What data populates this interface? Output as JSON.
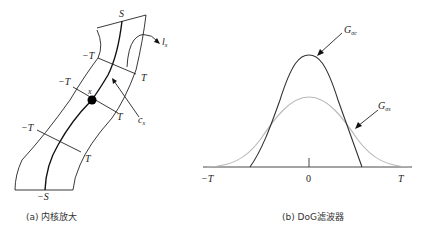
{
  "panel_a": {
    "caption": "(a) 内核放大",
    "labels": {
      "top_S": "S",
      "bottom_S": "−S",
      "neg_T": "−T",
      "pos_T": "T",
      "point_x": "x",
      "curve_c": "c",
      "curve_c_sub": "x",
      "line_l": "l",
      "line_l_sub": "x"
    }
  },
  "panel_b": {
    "caption": "(b) DoG滤波器",
    "labels": {
      "g_center": "G",
      "g_center_sub": "σc",
      "g_surround": "G",
      "g_surround_sub": "σs",
      "x_min": "−T",
      "x_zero": "0",
      "x_max": "T"
    },
    "colors": {
      "center_curve": "#333333",
      "surround_curve": "#b8b8b8"
    }
  }
}
